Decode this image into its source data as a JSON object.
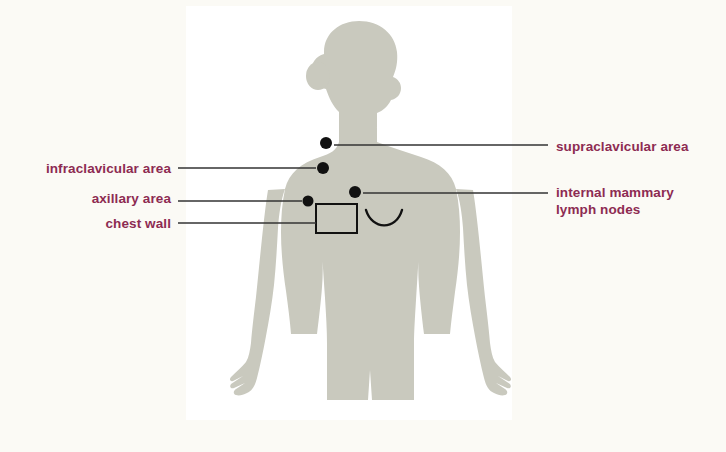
{
  "figure": {
    "panel": {
      "background_color": "#ffffff",
      "page_background_color": "#fbfaf5",
      "x": 186,
      "y": 6,
      "width": 326,
      "height": 414
    },
    "silhouette": {
      "name": "female-torso-silhouette",
      "fill_color": "#c9c9be",
      "description": "female figure in profile-head front-body view, arms at sides, cropped at thighs"
    },
    "marker_color": "#111111",
    "leader_line_color": "#333333",
    "label_color": "#8d2b52"
  },
  "labels": {
    "right": [
      {
        "id": "supraclavicular",
        "text": "supraclavicular area",
        "lines": [
          "supraclavicular area"
        ],
        "marker": {
          "x": 326,
          "y": 143,
          "r": 5.5
        },
        "leader": {
          "x1": 334,
          "y1": 145,
          "x2": 548,
          "y2": 145
        }
      },
      {
        "id": "internal-mammary",
        "text": "internal mammary lymph nodes",
        "lines": [
          "internal mammary",
          "lymph nodes"
        ],
        "marker": {
          "x": 355,
          "y": 192,
          "r": 5.5
        },
        "leader": {
          "x1": 363,
          "y1": 193,
          "x2": 548,
          "y2": 193
        }
      }
    ],
    "left": [
      {
        "id": "infraclavicular",
        "text": "infraclavicular area",
        "lines": [
          "infraclavicular area"
        ],
        "marker": {
          "x": 323,
          "y": 168,
          "r": 5.5
        },
        "leader": {
          "x1": 178,
          "y1": 168,
          "x2": 316,
          "y2": 168
        }
      },
      {
        "id": "axillary",
        "text": "axillary area",
        "lines": [
          "axillary area"
        ],
        "marker": {
          "x": 308,
          "y": 201,
          "r": 5.5
        },
        "leader": {
          "x1": 178,
          "y1": 201,
          "x2": 302,
          "y2": 201
        }
      },
      {
        "id": "chest-wall",
        "text": "chest wall",
        "lines": [
          "chest wall"
        ],
        "marker": null,
        "leader": {
          "x1": 178,
          "y1": 223,
          "x2": 316,
          "y2": 223
        }
      }
    ]
  },
  "annotations": {
    "chest_wall_box": {
      "x": 316,
      "y": 204,
      "width": 41,
      "height": 29,
      "stroke": "#111111",
      "stroke_width": 2
    },
    "breast_curve": {
      "description": "arc indicating breast contour",
      "stroke": "#111111",
      "stroke_width": 2.4
    }
  }
}
